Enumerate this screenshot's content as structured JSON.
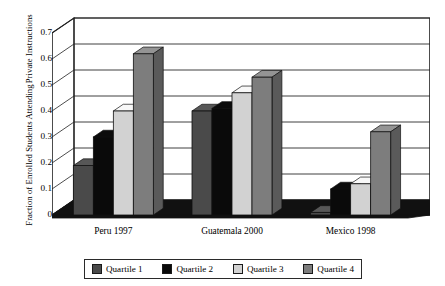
{
  "chart_data": {
    "type": "bar",
    "title": "",
    "xlabel": "",
    "ylabel_line1": "Fraction of Enrolled Students Attending",
    "ylabel_line2": "Private Instructions",
    "categories": [
      "Peru 1997",
      "Guatemala 2000",
      "Mexico 1998"
    ],
    "series": [
      {
        "name": "Quartile 1",
        "color": "#4a4a4a",
        "values": [
          0.19,
          0.4,
          0.01
        ]
      },
      {
        "name": "Quartile 2",
        "color": "#0a0a0a",
        "values": [
          0.3,
          0.41,
          0.1
        ]
      },
      {
        "name": "Quartile 3",
        "color": "#d2d2d2",
        "values": [
          0.4,
          0.47,
          0.12
        ]
      },
      {
        "name": "Quartile 4",
        "color": "#7d7d7d",
        "values": [
          0.62,
          0.53,
          0.32
        ]
      }
    ],
    "ylim": [
      0,
      0.7
    ],
    "yticks": [
      "0",
      "0.1",
      "0.2",
      "0.3",
      "0.4",
      "0.5",
      "0.6",
      "0.7"
    ],
    "ytick_values": [
      0,
      0.1,
      0.2,
      0.3,
      0.4,
      0.5,
      0.6,
      0.7
    ],
    "grid": true,
    "legend_position": "bottom",
    "style": "3d-grouped-bar"
  },
  "legend": {
    "items": [
      {
        "label": "Quartile 1",
        "color": "#4a4a4a"
      },
      {
        "label": "Quartile 2",
        "color": "#0a0a0a"
      },
      {
        "label": "Quartile 3",
        "color": "#d2d2d2"
      },
      {
        "label": "Quartile 4",
        "color": "#7d7d7d"
      }
    ]
  }
}
